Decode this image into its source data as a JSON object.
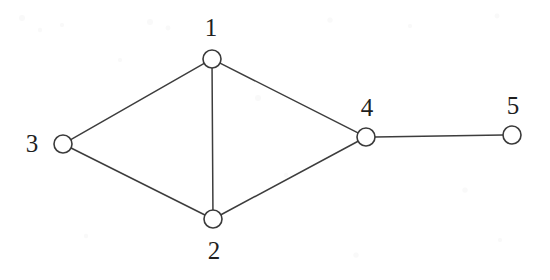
{
  "figure": {
    "kind": "undirected-graph",
    "background_color": "#ffffff",
    "stroke_color": "#3d3d3d",
    "node_fill_color": "#ffffff",
    "label_color": "#1f1f1f",
    "width": 550,
    "height": 280
  },
  "chart_data": {
    "type": "diagram",
    "title": "",
    "graph_type": "undirected",
    "node_count": 5,
    "edge_count": 6,
    "nodes": [
      {
        "id": "1",
        "label": "1",
        "x": 212,
        "y": 59,
        "r": 9,
        "label_x": 211,
        "label_y": 27,
        "label_position": "above"
      },
      {
        "id": "2",
        "label": "2",
        "x": 213,
        "y": 219,
        "r": 9,
        "label_x": 214,
        "label_y": 250,
        "label_position": "below"
      },
      {
        "id": "3",
        "label": "3",
        "x": 63,
        "y": 144,
        "r": 9,
        "label_x": 32,
        "label_y": 143,
        "label_position": "left"
      },
      {
        "id": "4",
        "label": "4",
        "x": 366,
        "y": 137,
        "r": 9,
        "label_x": 367,
        "label_y": 107,
        "label_position": "above"
      },
      {
        "id": "5",
        "label": "5",
        "x": 512,
        "y": 135,
        "r": 9,
        "label_x": 513,
        "label_y": 105,
        "label_position": "above"
      }
    ],
    "edges": [
      {
        "source": "1",
        "target": "3"
      },
      {
        "source": "1",
        "target": "2"
      },
      {
        "source": "1",
        "target": "4"
      },
      {
        "source": "3",
        "target": "2"
      },
      {
        "source": "2",
        "target": "4"
      },
      {
        "source": "4",
        "target": "5"
      }
    ],
    "adjacency": {
      "1": [
        "2",
        "3",
        "4"
      ],
      "2": [
        "1",
        "3",
        "4"
      ],
      "3": [
        "1",
        "2"
      ],
      "4": [
        "1",
        "2",
        "5"
      ],
      "5": [
        "4"
      ]
    },
    "degrees": {
      "1": 3,
      "2": 3,
      "3": 2,
      "4": 3,
      "5": 1
    }
  }
}
